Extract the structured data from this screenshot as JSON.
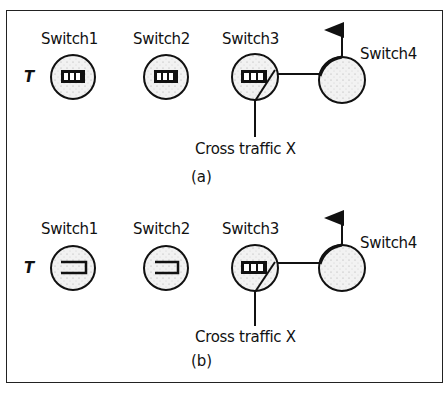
{
  "panels": [
    {
      "id": "a",
      "caption": "(a)",
      "input_label": "T",
      "switches": [
        {
          "name": "Switch1",
          "queue": "full"
        },
        {
          "name": "Switch2",
          "queue": "full"
        },
        {
          "name": "Switch3",
          "queue": "full"
        },
        {
          "name": "Switch4",
          "queue": "none"
        }
      ],
      "cross_traffic_label": "Cross traffic X"
    },
    {
      "id": "b",
      "caption": "(b)",
      "input_label": "T",
      "switches": [
        {
          "name": "Switch1",
          "queue": "empty"
        },
        {
          "name": "Switch2",
          "queue": "empty"
        },
        {
          "name": "Switch3",
          "queue": "full"
        },
        {
          "name": "Switch4",
          "queue": "none"
        }
      ],
      "cross_traffic_label": "Cross traffic X"
    }
  ],
  "colors": {
    "stroke": "#111111",
    "fill": "#eeeeee"
  }
}
